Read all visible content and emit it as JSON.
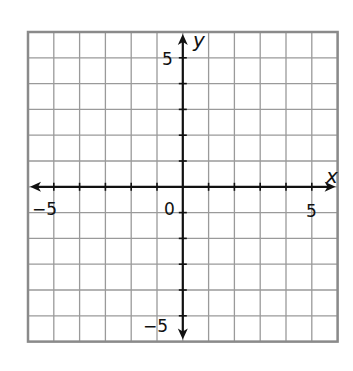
{
  "chart_data": {
    "type": "coordinate-grid",
    "title": "",
    "xlabel": "x",
    "ylabel": "y",
    "xlim": [
      -6,
      6
    ],
    "ylim": [
      -6,
      6
    ],
    "grid": true,
    "grid_step": 1,
    "tick_labels": {
      "x": [
        {
          "value": -5,
          "label": "−5"
        },
        {
          "value": 5,
          "label": "5"
        }
      ],
      "y": [
        {
          "value": 5,
          "label": "5"
        },
        {
          "value": -5,
          "label": "−5"
        }
      ],
      "origin": "0"
    },
    "series": []
  },
  "labels": {
    "x_axis": "x",
    "y_axis": "y",
    "origin": "0",
    "x_neg5": "−5",
    "x_pos5": "5",
    "y_pos5": "5",
    "y_neg5": "−5"
  },
  "colors": {
    "grid": "#9a9a9a",
    "border": "#8a8a8a",
    "axis": "#111111"
  }
}
